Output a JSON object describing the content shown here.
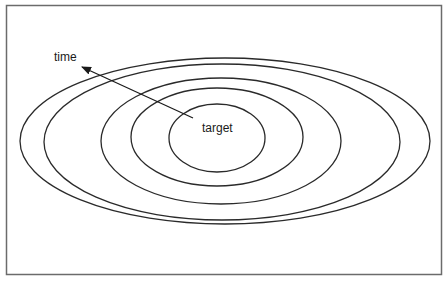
{
  "diagram": {
    "labels": {
      "time": "time",
      "target": "target"
    },
    "frame": {
      "x": 6,
      "y": 5,
      "width": 435,
      "height": 269,
      "stroke": "#6b6b6b"
    },
    "ellipses": [
      {
        "name": "ring-1",
        "cx": 217,
        "cy": 138,
        "rx": 48,
        "ry": 34
      },
      {
        "name": "ring-2",
        "cx": 217,
        "cy": 137,
        "rx": 86,
        "ry": 49
      },
      {
        "name": "ring-3",
        "cx": 221,
        "cy": 141,
        "rx": 120,
        "ry": 63
      },
      {
        "name": "ring-4",
        "cx": 222,
        "cy": 142,
        "rx": 178,
        "ry": 78
      },
      {
        "name": "ring-5",
        "cx": 225,
        "cy": 141,
        "rx": 205,
        "ry": 83
      }
    ],
    "arrow": {
      "from": [
        193,
        118
      ],
      "to": [
        82,
        67
      ],
      "meaning": "time"
    },
    "colors": {
      "line": "#2a2a2a",
      "background": "#ffffff"
    }
  }
}
